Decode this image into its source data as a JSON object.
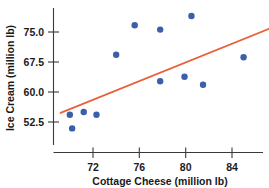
{
  "chart_data": {
    "type": "scatter",
    "title": "",
    "xlabel": "Cottage Cheese (million lb)",
    "ylabel": "Ice Cream (million lb)",
    "xlim": [
      69.2,
      86.2
    ],
    "ylim": [
      48.5,
      79.5
    ],
    "xticks": [
      72,
      76,
      80,
      84
    ],
    "yticks": [
      52.5,
      60.0,
      67.5,
      75.0
    ],
    "xtick_labels": [
      "72",
      "76",
      "80",
      "84"
    ],
    "ytick_labels": [
      "52.5",
      "67.5",
      "60.0",
      "75.0"
    ],
    "ytick_labels_ordered": [
      "52.5",
      "60.0",
      "67.5",
      "75.0"
    ],
    "grid": false,
    "legend": false,
    "legend_position": "none",
    "point_color": "#3b5fa8",
    "line_color": "#e8613a",
    "axis_color": "#3a3a3a",
    "background": "#ffffff",
    "points": [
      {
        "x": 70.0,
        "y": 54.3
      },
      {
        "x": 70.2,
        "y": 50.9
      },
      {
        "x": 71.2,
        "y": 55.0
      },
      {
        "x": 72.3,
        "y": 54.3
      },
      {
        "x": 74.0,
        "y": 69.3
      },
      {
        "x": 75.6,
        "y": 76.7
      },
      {
        "x": 77.8,
        "y": 75.6
      },
      {
        "x": 77.8,
        "y": 62.7
      },
      {
        "x": 79.9,
        "y": 63.8
      },
      {
        "x": 80.5,
        "y": 79.0
      },
      {
        "x": 81.5,
        "y": 61.8
      },
      {
        "x": 85.0,
        "y": 68.7
      }
    ],
    "trend_line": {
      "label": "regression line",
      "x_start": 69.2,
      "y_start": 54.8,
      "x_end": 87.2,
      "y_end": 75.8
    }
  }
}
